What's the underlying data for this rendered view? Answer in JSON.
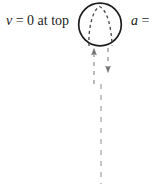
{
  "figure": {
    "type": "physics-diagram",
    "width": 157,
    "height": 184,
    "background_color": "#ffffff",
    "ink_color": "#1c1c1c"
  },
  "labels": {
    "velocity": {
      "variable": "v",
      "rest": " = 0 at top",
      "full": "v = 0 at top"
    },
    "acceleration": {
      "variable": "a",
      "rest": " =",
      "full": "a ="
    }
  },
  "ball": {
    "name": "ball-circle",
    "cx": 100,
    "cy": 24.5,
    "r": 21.5,
    "stroke_color": "#1c1c1c",
    "stroke_width": 1.6
  },
  "trajectory_arc": {
    "name": "dashed-parabolic-arc",
    "style": "dashed",
    "stroke_color": "#4a4a4a",
    "stroke_width": 1.3,
    "dash_pattern": "3,3"
  },
  "arrows": {
    "up": {
      "name": "up-arrow",
      "direction": "up",
      "x": 94,
      "tip_y": 49,
      "tail_y": 83,
      "color": "#6e6e6e"
    },
    "down": {
      "name": "down-arrow",
      "direction": "down",
      "x": 108,
      "tip_y": 72,
      "tail_y": 48,
      "color": "#6e6e6e"
    }
  },
  "motion_line": {
    "name": "vertical-dashed-motion-line",
    "x": 101,
    "y_start": 84,
    "y_end": 184,
    "style": "dashed",
    "color": "#a8a8a8",
    "dash_pattern": "5,6"
  }
}
